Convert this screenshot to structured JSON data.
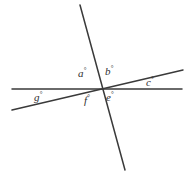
{
  "figure": {
    "type": "line-intersection-diagram",
    "background_color": "#ffffff",
    "stroke_color": "#3a3a3a",
    "stroke_width": 1.5,
    "width": 193,
    "height": 179,
    "intersection_point": {
      "x": 101,
      "y": 89
    }
  },
  "lines": [
    {
      "name": "horizontal-line",
      "x1": 12,
      "y1": 89,
      "x2": 182,
      "y2": 89
    },
    {
      "name": "steep-line",
      "x1": 80,
      "y1": 5,
      "x2": 125,
      "y2": 170
    },
    {
      "name": "slanted-line",
      "x1": 12,
      "y1": 110,
      "x2": 183,
      "y2": 70
    }
  ],
  "labels": [
    {
      "name": "angle-a",
      "text": "a",
      "degree": "°",
      "x": 78,
      "y": 67
    },
    {
      "name": "angle-b",
      "text": "b",
      "degree": "°",
      "x": 105,
      "y": 65
    },
    {
      "name": "angle-c",
      "text": "c",
      "degree": "°",
      "x": 146,
      "y": 76
    },
    {
      "name": "angle-e",
      "text": "e",
      "degree": "°",
      "x": 106,
      "y": 91
    },
    {
      "name": "angle-f",
      "text": "f",
      "degree": "°",
      "x": 84,
      "y": 94
    },
    {
      "name": "angle-g",
      "text": "g",
      "degree": "°",
      "x": 34,
      "y": 91
    }
  ]
}
